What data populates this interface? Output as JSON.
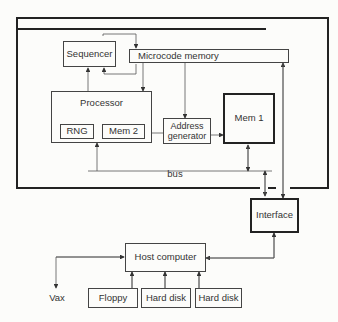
{
  "diagram": {
    "title": "",
    "blocks": {
      "sequencer": "Sequencer",
      "microcode_memory": "Microcode memory",
      "processor": "Processor",
      "rng": "RNG",
      "mem2": "Mem 2",
      "address_generator": "Address generator",
      "mem1": "Mem 1",
      "bus": "bus",
      "interface": "Interface",
      "host_computer": "Host computer",
      "vax": "Vax",
      "floppy": "Floppy",
      "hard_disk_1": "Hard disk",
      "hard_disk_2": "Hard disk"
    },
    "colors": {
      "line": "#444444",
      "background": "#fcfcfa"
    }
  }
}
